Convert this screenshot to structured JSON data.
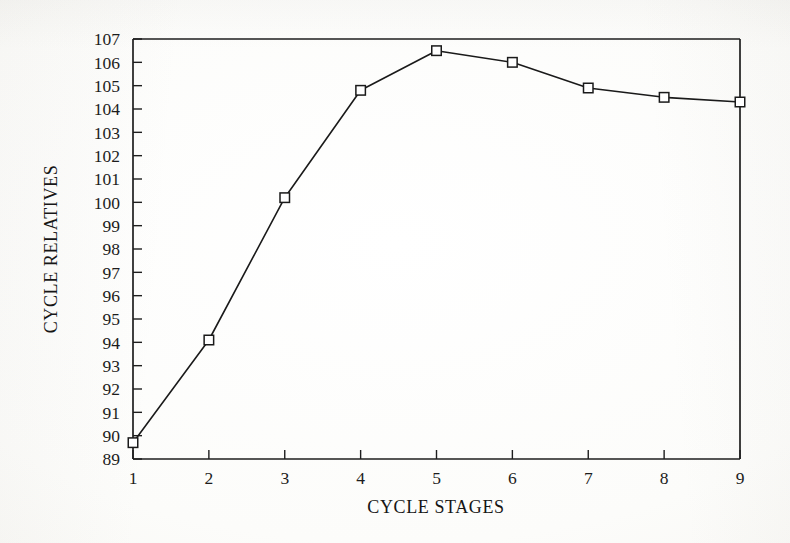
{
  "chart_data": {
    "type": "line",
    "title": "",
    "xlabel": "CYCLE STAGES",
    "ylabel": "CYCLE RELATIVES",
    "x": [
      1,
      2,
      3,
      4,
      5,
      6,
      7,
      8,
      9
    ],
    "categories": [
      "1",
      "2",
      "3",
      "4",
      "5",
      "6",
      "7",
      "8",
      "9"
    ],
    "values": [
      89.7,
      94.1,
      100.2,
      104.8,
      106.5,
      106.0,
      104.9,
      104.5,
      104.3
    ],
    "series": [
      {
        "name": "Cycle relatives",
        "values": [
          89.7,
          94.1,
          100.2,
          104.8,
          106.5,
          106.0,
          104.9,
          104.5,
          104.3
        ]
      }
    ],
    "xlim": [
      1,
      9
    ],
    "ylim": [
      89,
      107
    ],
    "xticks": [
      "1",
      "2",
      "3",
      "4",
      "5",
      "6",
      "7",
      "8",
      "9"
    ],
    "yticks": [
      "89",
      "90",
      "91",
      "92",
      "93",
      "94",
      "95",
      "96",
      "97",
      "98",
      "99",
      "100",
      "101",
      "102",
      "103",
      "104",
      "105",
      "106",
      "107"
    ],
    "grid": false,
    "legend_position": "none",
    "marker": "open-square",
    "line_color": "#1a1a1a",
    "marker_color": "#1a1a1a",
    "marker_fill": "#ffffff",
    "background_color": "#fdfdfb",
    "annotations": []
  },
  "axes": {
    "x_title": "CYCLE STAGES",
    "y_title": "CYCLE RELATIVES"
  }
}
